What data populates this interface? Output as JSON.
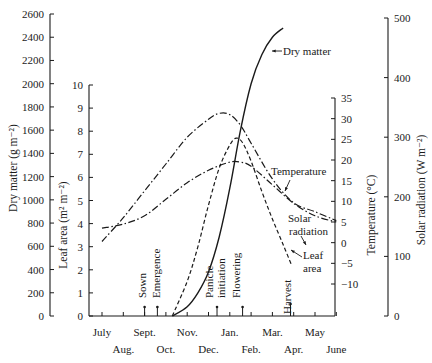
{
  "chart_data": {
    "type": "line",
    "title": "",
    "xlabel": "",
    "x_ticks_top": [
      "July",
      "Sept.",
      "Nov.",
      "Jan.",
      "Mar.",
      "May"
    ],
    "x_ticks_bottom": [
      "Aug.",
      "Oct.",
      "Dec.",
      "Feb.",
      "Apr.",
      "June"
    ],
    "months": [
      "July",
      "Aug.",
      "Sept.",
      "Oct.",
      "Nov.",
      "Dec.",
      "Jan.",
      "Feb.",
      "Mar.",
      "Apr.",
      "May",
      "June"
    ],
    "axes": {
      "dry_matter": {
        "label": "Dry matter (g m⁻²)",
        "range": [
          0,
          2600
        ],
        "ticks": [
          0,
          200,
          400,
          600,
          800,
          1000,
          1200,
          1400,
          1600,
          1800,
          2000,
          2200,
          2400,
          2600
        ]
      },
      "leaf_area": {
        "label": "Leaf area (m² m⁻²)",
        "range": [
          0,
          10
        ],
        "ticks": [
          0,
          1,
          2,
          3,
          4,
          5,
          6,
          7,
          8,
          9,
          10
        ]
      },
      "temperature": {
        "label": "Temperature (°C)",
        "range": [
          -10,
          35
        ],
        "ticks": [
          -10,
          -5,
          0,
          5,
          10,
          15,
          20,
          25,
          30,
          35
        ]
      },
      "solar_radiation": {
        "label": "Solar radiation (W m⁻²)",
        "range": [
          0,
          500
        ],
        "ticks": [
          0,
          100,
          200,
          300,
          400,
          500
        ]
      }
    },
    "series": [
      {
        "name": "Dry matter",
        "axis": "dry_matter",
        "style": "solid",
        "x_month_index": [
          3.3,
          4.0,
          4.5,
          5.0,
          5.5,
          6.0,
          6.5,
          7.0,
          7.5,
          8.0,
          8.5
        ],
        "values": [
          0,
          80,
          200,
          380,
          680,
          1100,
          1600,
          2000,
          2250,
          2400,
          2480
        ]
      },
      {
        "name": "Leaf area",
        "axis": "leaf_area",
        "style": "dashed",
        "x_month_index": [
          3.3,
          4.0,
          4.5,
          5.0,
          5.5,
          6.0,
          6.3,
          6.6,
          7.0,
          7.5,
          8.0,
          8.5,
          8.9
        ],
        "values": [
          0,
          1.5,
          3.0,
          4.8,
          6.4,
          7.4,
          7.7,
          7.5,
          6.7,
          5.4,
          4.2,
          3.1,
          2.2
        ]
      },
      {
        "name": "Temperature",
        "axis": "temperature",
        "style": "dash-dot",
        "x_month_index": [
          0,
          1,
          2,
          3,
          4,
          5,
          6,
          6.5,
          7,
          8,
          9,
          10,
          11
        ],
        "values": [
          3.5,
          4.5,
          6.5,
          10.5,
          14.5,
          17.5,
          19.5,
          19.5,
          18.5,
          14,
          9.5,
          6.5,
          5
        ]
      },
      {
        "name": "Solar radiation",
        "axis": "solar_radiation",
        "style": "dash-dot",
        "x_month_index": [
          0,
          1,
          2,
          3,
          4,
          5,
          5.5,
          6,
          6.5,
          7,
          8,
          9,
          10,
          11
        ],
        "values": [
          125,
          165,
          210,
          255,
          300,
          330,
          340,
          338,
          320,
          290,
          230,
          190,
          175,
          160
        ]
      }
    ],
    "annotations": [
      {
        "text": "Sown",
        "x_month_index": 2.0
      },
      {
        "text": "Emergence",
        "x_month_index": 2.6
      },
      {
        "text": "Panicle initiation",
        "x_month_index": 5.4
      },
      {
        "text": "Flowering",
        "x_month_index": 6.6
      },
      {
        "text": "Harvest",
        "x_month_index": 8.85
      }
    ],
    "curve_labels": [
      "Dry matter",
      "Temperature",
      "Solar radiation",
      "Leaf area"
    ],
    "grid": false,
    "legend": "inline labels"
  },
  "labels": {
    "dry_matter_axis": "Dry matter (g m⁻²)",
    "leaf_area_axis": "Leaf area (m² m⁻²)",
    "temperature_axis": "Temperature (°C)",
    "solar_axis": "Solar radiation (W m⁻²)",
    "curve_dry_matter": "Dry matter",
    "curve_temperature": "Temperature",
    "curve_solar_1": "Solar",
    "curve_solar_2": "radiation",
    "curve_leaf_1": "Leaf",
    "curve_leaf_2": "area",
    "event_sown": "Sown",
    "event_emergence": "Emergence",
    "event_panicle_1": "Panicle",
    "event_panicle_2": "initiation",
    "event_flowering": "Flowering",
    "event_harvest": "Harvest"
  }
}
